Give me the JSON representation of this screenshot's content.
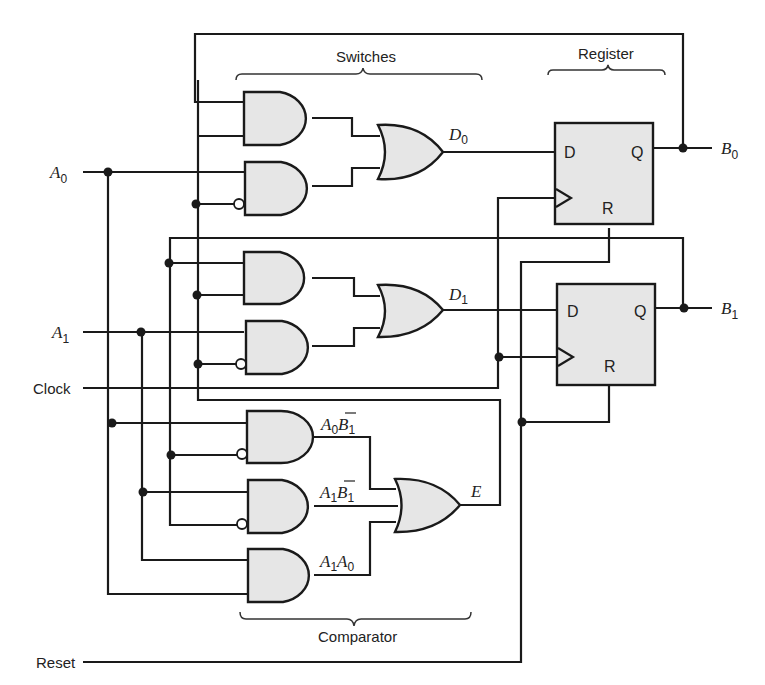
{
  "diagram": {
    "groups": {
      "switches": "Switches",
      "register": "Register",
      "comparator": "Comparator"
    },
    "inputs": {
      "a0": {
        "var": "A",
        "sub": "0"
      },
      "a1": {
        "var": "A",
        "sub": "1"
      },
      "clock": "Clock",
      "reset": "Reset"
    },
    "outputs": {
      "b0": {
        "var": "B",
        "sub": "0"
      },
      "b1": {
        "var": "B",
        "sub": "1"
      },
      "e": "E"
    },
    "signals": {
      "d0": {
        "var": "D",
        "sub": "0"
      },
      "d1": {
        "var": "D",
        "sub": "1"
      },
      "a0_b1bar": {
        "v1": "A",
        "s1": "0",
        "v2": "B",
        "s2": "1",
        "overline": true
      },
      "a1_b1bar": {
        "v1": "A",
        "s1": "1",
        "v2": "B",
        "s2": "1",
        "overline": true
      },
      "a1_a0": {
        "v1": "A",
        "s1": "1",
        "v2": "A",
        "s2": "0"
      }
    },
    "flipflop_pins": {
      "d": "D",
      "q": "Q",
      "r": "R"
    },
    "gates": [
      {
        "id": "and-sw0-a",
        "type": "AND"
      },
      {
        "id": "and-sw0-b",
        "type": "AND",
        "inverted_input": "lower"
      },
      {
        "id": "or-d0",
        "type": "OR"
      },
      {
        "id": "and-sw1-a",
        "type": "AND"
      },
      {
        "id": "and-sw1-b",
        "type": "AND",
        "inverted_input": "lower"
      },
      {
        "id": "or-d1",
        "type": "OR"
      },
      {
        "id": "and-cmp-1",
        "type": "AND",
        "inverted_input": "lower"
      },
      {
        "id": "and-cmp-2",
        "type": "AND",
        "inverted_input": "lower"
      },
      {
        "id": "and-cmp-3",
        "type": "AND"
      },
      {
        "id": "or-e",
        "type": "OR"
      },
      {
        "id": "dff-0",
        "type": "D flip-flop"
      },
      {
        "id": "dff-1",
        "type": "D flip-flop"
      }
    ]
  }
}
